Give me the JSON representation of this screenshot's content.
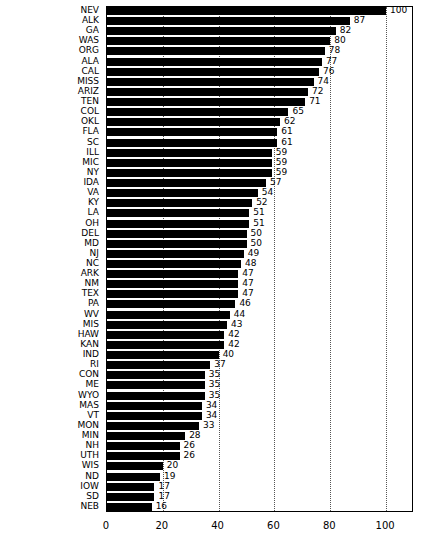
{
  "chart_data": {
    "type": "bar",
    "orientation": "horizontal",
    "title": "",
    "subtitle": "",
    "xlabel": "",
    "ylabel": "",
    "xlim": [
      0,
      110
    ],
    "ylim": [
      0,
      50
    ],
    "grid": true,
    "grid_axis": "x",
    "legend": false,
    "legend_position": "none",
    "bar_color": "#000000",
    "background_color": "#ffffff",
    "axis_color": "#000000",
    "gridline_color": "#555555",
    "gridline_style": "dotted",
    "value_labels_shown": true,
    "xticks": [
      0,
      20,
      40,
      60,
      80,
      100
    ],
    "xtick_labels": [
      "0",
      "20",
      "40",
      "60",
      "80",
      "100"
    ],
    "categories": [
      "NEV",
      "ALK",
      "GA",
      "WAS",
      "ORG",
      "ALA",
      "CAL",
      "MISS",
      "ARIZ",
      "TEN",
      "COL",
      "OKL",
      "FLA",
      "SC",
      "ILL",
      "MIC",
      "NY",
      "IDA",
      "VA",
      "KY",
      "LA",
      "OH",
      "DEL",
      "MD",
      "NJ",
      "NC",
      "ARK",
      "NM",
      "TEX",
      "PA",
      "WV",
      "MIS",
      "HAW",
      "KAN",
      "IND",
      "RI",
      "CON",
      "ME",
      "WYO",
      "MAS",
      "VT",
      "MON",
      "MIN",
      "NH",
      "UTH",
      "WIS",
      "ND",
      "IOW",
      "SD",
      "NEB"
    ],
    "values": [
      100,
      87,
      82,
      80,
      78,
      77,
      76,
      74,
      72,
      71,
      65,
      62,
      61,
      61,
      59,
      59,
      59,
      57,
      54,
      52,
      51,
      51,
      50,
      50,
      49,
      48,
      47,
      47,
      47,
      46,
      44,
      43,
      42,
      42,
      40,
      37,
      35,
      35,
      35,
      34,
      34,
      33,
      28,
      26,
      26,
      20,
      19,
      17,
      17,
      16
    ],
    "value_label_texts": [
      "100",
      "87",
      "82",
      "80",
      "78",
      "77",
      "76",
      "74",
      "72",
      "71",
      "65",
      "62",
      "61",
      "61",
      "59",
      "59",
      "59",
      "57",
      "54",
      "52",
      "51",
      "51",
      "50",
      "50",
      "49",
      "48",
      "47",
      "47",
      "47",
      "46",
      "44",
      "43",
      "42",
      "42",
      "40",
      "37",
      "35",
      "35",
      "35",
      "34",
      "34",
      "33",
      "28",
      "26",
      "26",
      "20",
      "19",
      "17",
      "17",
      "16"
    ]
  }
}
